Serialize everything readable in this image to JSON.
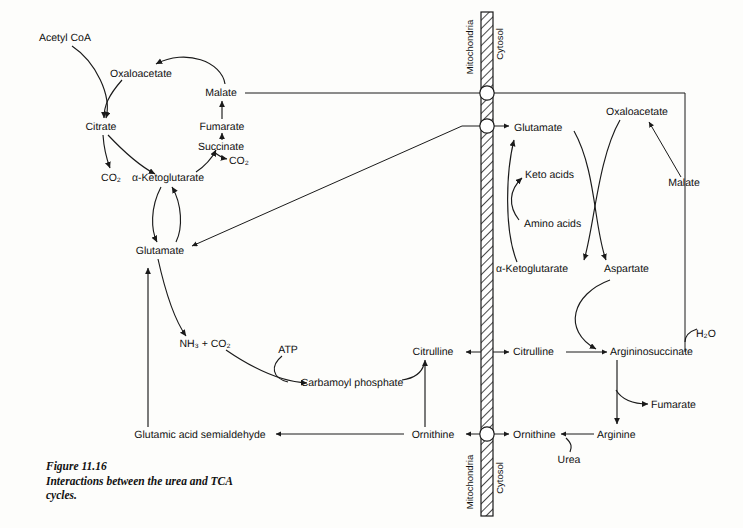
{
  "figure": {
    "number": "Figure 11.16",
    "caption_line1": "Interactions between the urea and TCA",
    "caption_line2": "cycles."
  },
  "compartments": {
    "mitochondria_top": "Mitochondria",
    "cytosol_top": "Cytosol",
    "mitochondria_bottom": "Mitochondria",
    "cytosol_bottom": "Cytosol"
  },
  "tca_cycle": {
    "acetyl_coa": "Acetyl CoA",
    "oxaloacetate": "Oxaloacetate",
    "citrate": "Citrate",
    "co2_citrate": "CO₂",
    "alpha_ketoglutarate": "α-Ketoglutarate",
    "succinate": "Succinate",
    "co2_succinate": "CO₂",
    "fumarate": "Fumarate",
    "malate": "Malate",
    "glutamate": "Glutamate"
  },
  "mitochondrial_urea": {
    "nh3_co2": "NH₃ + CO₂",
    "atp": "ATP",
    "carbamoyl_phosphate": "Carbamoyl phosphate",
    "glutamic_acid_semialdehyde": "Glutamic acid semialdehyde",
    "citrulline": "Citrulline",
    "ornithine": "Ornithine"
  },
  "cytosol": {
    "glutamate": "Glutamate",
    "keto_acids": "Keto acids",
    "amino_acids": "Amino acids",
    "alpha_ketoglutarate": "α-Ketoglutarate",
    "aspartate": "Aspartate",
    "oxaloacetate": "Oxaloacetate",
    "malate": "Malate",
    "h2o": "H₂O",
    "citrulline": "Citrulline",
    "argininosuccinate": "Argininosuccinate",
    "fumarate": "Fumarate",
    "ornithine": "Ornithine",
    "arginine": "Arginine",
    "urea": "Urea"
  },
  "colors": {
    "ink": "#1a1a1a",
    "paper": "#fdfdfb"
  }
}
